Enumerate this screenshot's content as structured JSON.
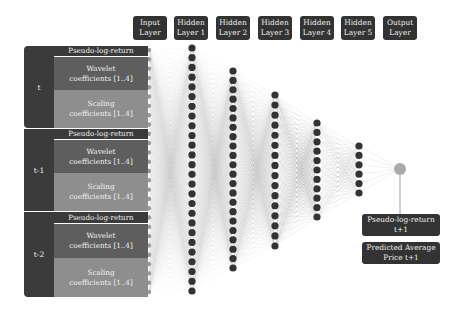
{
  "headers": [
    {
      "line1": "Input",
      "line2": "Layer"
    },
    {
      "line1": "Hidden",
      "line2": "Layer 1"
    },
    {
      "line1": "Hidden",
      "line2": "Layer 2"
    },
    {
      "line1": "Hidden",
      "line2": "Layer 3"
    },
    {
      "line1": "Hidden",
      "line2": "Layer 4"
    },
    {
      "line1": "Hidden",
      "line2": "Layer 5"
    },
    {
      "line1": "Output",
      "line2": "Layer"
    }
  ],
  "input_groups": [
    {
      "label": "t",
      "rows": [
        {
          "l1": "Pseudo-log-return",
          "l2": ""
        },
        {
          "l1": "Wavelet",
          "l2": "coefficients [1..4]"
        },
        {
          "l1": "Scaling",
          "l2": "coefficients [1..4]"
        }
      ]
    },
    {
      "label": "t-1",
      "rows": [
        {
          "l1": "Pseudo-log-return",
          "l2": ""
        },
        {
          "l1": "Wavelet",
          "l2": "coefficients [1..4]"
        },
        {
          "l1": "Scaling",
          "l2": "coefficients [1..4]"
        }
      ]
    },
    {
      "label": "t-2",
      "rows": [
        {
          "l1": "Pseudo-log-return",
          "l2": ""
        },
        {
          "l1": "Wavelet",
          "l2": "coefficients [1..4]"
        },
        {
          "l1": "Scaling",
          "l2": "coefficients [1..4]"
        }
      ]
    }
  ],
  "outputs": [
    {
      "l1": "Pseudo-log-return",
      "l2": "t+1"
    },
    {
      "l1": "Predicted Average",
      "l2": "Price t+1"
    }
  ],
  "network": {
    "layers": [
      {
        "name": "Input Layer",
        "x": 149,
        "y0": 50,
        "y1": 292,
        "count": 27,
        "node_color": "#9a9a9a",
        "r": 2.2
      },
      {
        "name": "Hidden Layer 1",
        "x": 192,
        "y0": 48,
        "y1": 291,
        "count": 26,
        "node_color": "#333333",
        "r": 3.6
      },
      {
        "name": "Hidden Layer 2",
        "x": 233,
        "y0": 71,
        "y1": 268,
        "count": 22,
        "node_color": "#333333",
        "r": 3.6
      },
      {
        "name": "Hidden Layer 3",
        "x": 275,
        "y0": 95,
        "y1": 246,
        "count": 16,
        "node_color": "#333333",
        "r": 3.6
      },
      {
        "name": "Hidden Layer 4",
        "x": 317,
        "y0": 123,
        "y1": 217,
        "count": 11,
        "node_color": "#333333",
        "r": 3.6
      },
      {
        "name": "Hidden Layer 5",
        "x": 359,
        "y0": 146,
        "y1": 193,
        "count": 6,
        "node_color": "#333333",
        "r": 3.6
      },
      {
        "name": "Output Layer",
        "x": 400,
        "y0": 169,
        "y1": 169,
        "count": 1,
        "node_color": "#aaaaaa",
        "r": 6
      }
    ],
    "edge_color": "#9a9a9a"
  }
}
